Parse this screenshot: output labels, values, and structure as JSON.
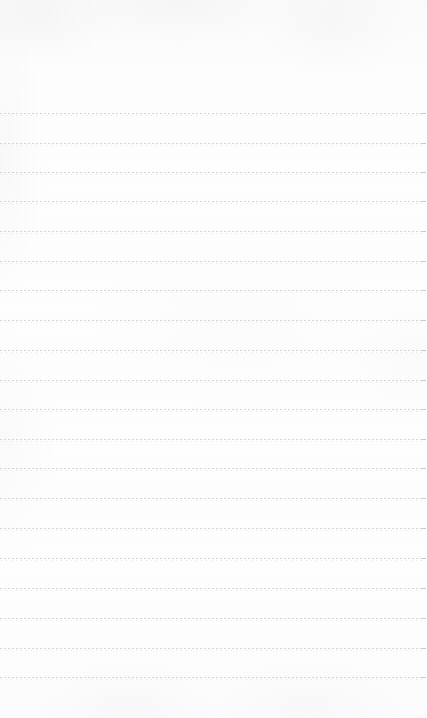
{
  "document": {
    "kind": "lined-paper-page",
    "title": "",
    "body_text": "",
    "page_width": 427,
    "page_height": 718,
    "paper_color": "#fdfdfd",
    "rule_color": "#d6d7db",
    "rule_terminal_color": "#c9cacf",
    "rule_style": "dotted",
    "rule_dash_px": 2,
    "rule_gap_px": 2,
    "rule_thickness_px": 1,
    "rule_count": 20,
    "first_rule_y": 113,
    "last_rule_y": 677,
    "rule_spacing_px": 29.7,
    "rule_left_x": 0,
    "rule_right_x": 425,
    "top_margin_px": 113,
    "bottom_margin_px": 41,
    "has_vertical_margin_rule": false,
    "has_page_number": false,
    "has_text_content": false
  },
  "rules": [
    {
      "index": 1,
      "y": 113
    },
    {
      "index": 2,
      "y": 143
    },
    {
      "index": 3,
      "y": 172
    },
    {
      "index": 4,
      "y": 201
    },
    {
      "index": 5,
      "y": 231
    },
    {
      "index": 6,
      "y": 261
    },
    {
      "index": 7,
      "y": 290
    },
    {
      "index": 8,
      "y": 320
    },
    {
      "index": 9,
      "y": 350
    },
    {
      "index": 10,
      "y": 380
    },
    {
      "index": 11,
      "y": 409
    },
    {
      "index": 12,
      "y": 439
    },
    {
      "index": 13,
      "y": 468
    },
    {
      "index": 14,
      "y": 498
    },
    {
      "index": 15,
      "y": 528
    },
    {
      "index": 16,
      "y": 558
    },
    {
      "index": 17,
      "y": 588
    },
    {
      "index": 18,
      "y": 618
    },
    {
      "index": 19,
      "y": 648
    },
    {
      "index": 20,
      "y": 677
    }
  ],
  "writing_lines": [
    {
      "index": 1,
      "content": ""
    },
    {
      "index": 2,
      "content": ""
    },
    {
      "index": 3,
      "content": ""
    },
    {
      "index": 4,
      "content": ""
    },
    {
      "index": 5,
      "content": ""
    },
    {
      "index": 6,
      "content": ""
    },
    {
      "index": 7,
      "content": ""
    },
    {
      "index": 8,
      "content": ""
    },
    {
      "index": 9,
      "content": ""
    },
    {
      "index": 10,
      "content": ""
    },
    {
      "index": 11,
      "content": ""
    },
    {
      "index": 12,
      "content": ""
    },
    {
      "index": 13,
      "content": ""
    },
    {
      "index": 14,
      "content": ""
    },
    {
      "index": 15,
      "content": ""
    },
    {
      "index": 16,
      "content": ""
    },
    {
      "index": 17,
      "content": ""
    },
    {
      "index": 18,
      "content": ""
    },
    {
      "index": 19,
      "content": ""
    },
    {
      "index": 20,
      "content": ""
    }
  ],
  "header_area": {
    "content": ""
  },
  "footer_area": {
    "content": ""
  }
}
